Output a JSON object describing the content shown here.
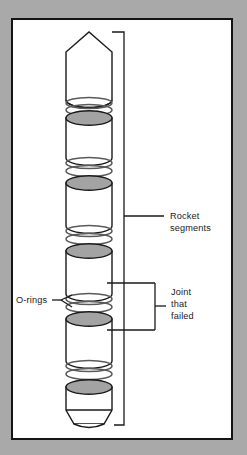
{
  "figure": {
    "background_color": "#a9a9a9",
    "panel_color": "#ffffff",
    "panel_border_color": "#141414",
    "line_color": "#1a1a1a",
    "oring_stroke_color": "#555555",
    "segment_top_fill": "#a3a3a3",
    "segment_body_fill": "#ffffff"
  },
  "labels": {
    "rocket_segments": {
      "lines": [
        "Rocket",
        "segments"
      ],
      "line1": "Rocket",
      "line2": "segments"
    },
    "o_rings": {
      "text": "O-rings"
    },
    "joint_that_failed": {
      "lines": [
        "Joint",
        "that",
        "failed"
      ],
      "line1": "Joint",
      "line2": "that",
      "line3": "failed"
    }
  },
  "diagram": {
    "segment_count": 6,
    "oring_pair_count": 5,
    "segments": [
      {
        "index": 1,
        "name": "nose-cone-segment",
        "shape": "pointed-nose",
        "top": 32,
        "bottom": 100
      },
      {
        "index": 2,
        "name": "rocket-segment-2",
        "shape": "cylinder",
        "top": 110,
        "bottom": 158
      },
      {
        "index": 3,
        "name": "rocket-segment-3",
        "shape": "cylinder",
        "top": 175,
        "bottom": 226
      },
      {
        "index": 4,
        "name": "rocket-segment-4",
        "shape": "cylinder",
        "top": 241,
        "bottom": 294
      },
      {
        "index": 5,
        "name": "rocket-segment-5",
        "shape": "cylinder",
        "top": 308,
        "bottom": 361
      },
      {
        "index": 6,
        "name": "nozzle-segment",
        "shape": "rounded-nozzle",
        "top": 379,
        "bottom": 425
      }
    ],
    "oring_pairs": [
      {
        "index": 1,
        "between": [
          1,
          2
        ],
        "y_top": 100,
        "y_bottom": 108
      },
      {
        "index": 2,
        "between": [
          2,
          3
        ],
        "y_top": 161,
        "y_bottom": 170
      },
      {
        "index": 3,
        "between": [
          3,
          4
        ],
        "y_top": 228,
        "y_bottom": 237
      },
      {
        "index": 4,
        "between": [
          4,
          5
        ],
        "y_top": 296,
        "y_bottom": 305
      },
      {
        "index": 5,
        "between": [
          5,
          6
        ],
        "y_top": 364,
        "y_bottom": 373
      }
    ],
    "brackets": {
      "rocket_segments_bracket": {
        "x": 124,
        "y_top": 32,
        "y_bottom": 425,
        "leader_y": 216
      },
      "joint_bracket": {
        "x": 155,
        "y_top": 283,
        "y_bottom": 323,
        "leader_y": 303
      }
    }
  }
}
